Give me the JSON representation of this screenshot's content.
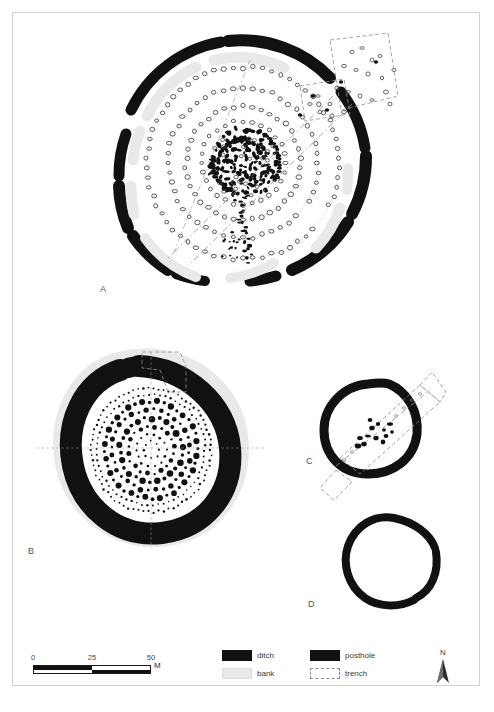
{
  "figure": {
    "panels": [
      {
        "id": "A",
        "label": "A",
        "type": "large-henge-with-timber-circles",
        "description": "Large henge with segmented outer ditch, internal bank segments, multiple concentric posthole rings and dense central timber structure, with excavation trench across the north-east entrance"
      },
      {
        "id": "B",
        "label": "B",
        "type": "henge-with-dense-posthole-rings",
        "description": "Henge with broad black ditch, outer bank and concentric rings of postholes filling the interior"
      },
      {
        "id": "C",
        "label": "C",
        "type": "ring-ditch-with-trench",
        "description": "Small ring ditch crossed diagonally by an excavation trench with a central posthole cluster"
      },
      {
        "id": "D",
        "label": "D",
        "type": "plain-ring-ditch",
        "description": "Plain ring ditch with a single narrow causeway gap on the east side"
      }
    ]
  },
  "scalebar": {
    "ticks": [
      "0",
      "25",
      "50"
    ],
    "unit": "M",
    "segments": 4,
    "max": 50
  },
  "legend": {
    "items": [
      {
        "key": "ditch",
        "label": "ditch",
        "swatch": "solid-black"
      },
      {
        "key": "posthole",
        "label": "posthole",
        "swatch": "solid-black"
      },
      {
        "key": "bank",
        "label": "bank",
        "swatch": "light-grey"
      },
      {
        "key": "trench",
        "label": "trench",
        "swatch": "dashed-outline"
      }
    ]
  },
  "north": {
    "letter": "N"
  },
  "colors": {
    "ditch": "#111111",
    "posthole": "#111111",
    "bank": "#e9e9e9",
    "trench_outline": "#8e8e8e",
    "background": "#ffffff",
    "frame": "#d2d2d2",
    "label_text": "#555555"
  }
}
